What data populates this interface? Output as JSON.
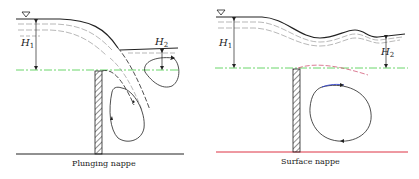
{
  "panels": [
    {
      "id": "plunging",
      "caption": "Plunging nappe",
      "labels": {
        "h1": "H",
        "h1_sub": "1",
        "h2": "H",
        "h2_sub": "2"
      }
    },
    {
      "id": "surface",
      "caption": "Surface nappe",
      "labels": {
        "h1": "H",
        "h1_sub": "1",
        "h2": "H",
        "h2_sub": "2"
      }
    }
  ],
  "colors": {
    "line": "#222222",
    "crest_line": "#44cc44",
    "bed_left": "#222222",
    "bed_right": "#dd3344",
    "vortex_accent": "#3344cc",
    "nappe_dash": "#cc4466"
  }
}
